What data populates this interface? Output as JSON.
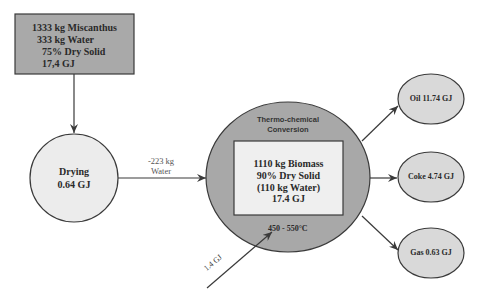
{
  "diagram": {
    "type": "process-flow",
    "colors": {
      "input_box_fill": "#a9a9a9",
      "drying_fill": "#ececec",
      "reactor_fill": "#a8a8a8",
      "inner_box_fill": "#efefef",
      "output_fill": "#d9d9d9",
      "stroke": "#3a3a3a"
    },
    "input": {
      "line1": "1333 kg Miscanthus",
      "line2": "333 kg Water",
      "line3": "75% Dry Solid",
      "line4": "17,4 GJ"
    },
    "drying": {
      "title": "Drying",
      "energy": "0.64 GJ"
    },
    "water_removed": {
      "line1": "-223 kg",
      "line2": "Water"
    },
    "reactor": {
      "title_line1": "Thermo-chemical",
      "title_line2": "Conversion",
      "inner": {
        "line1": "1110 kg Biomass",
        "line2": "90% Dry Solid",
        "line3": "(110 kg Water)",
        "line4": "17.4 GJ"
      },
      "temperature": "450 - 550°C"
    },
    "energy_input": "1.4 GJ",
    "outputs": [
      {
        "label": "Oil 11.74 GJ"
      },
      {
        "label": "Coke 4.74 GJ"
      },
      {
        "label": "Gas 0.63 GJ"
      }
    ]
  }
}
